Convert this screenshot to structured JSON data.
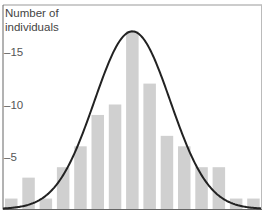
{
  "chart_data": {
    "type": "bar",
    "title": "",
    "xlabel": "",
    "ylabel": "Number of individuals",
    "ylabel_lines": [
      "Number of",
      "individuals"
    ],
    "categories": [
      "1",
      "2",
      "3",
      "4",
      "5",
      "6",
      "7",
      "8",
      "9",
      "10",
      "11",
      "12",
      "13",
      "14",
      "15"
    ],
    "values": [
      1,
      3,
      1,
      4,
      6,
      9,
      10,
      17,
      12,
      7,
      6,
      4,
      4,
      1,
      1
    ],
    "overlay": {
      "type": "normal_curve",
      "peak": 17,
      "color": "#222222"
    },
    "yticks": [
      5,
      10,
      15
    ],
    "ytick_labels": [
      "–5",
      "–10",
      "–15"
    ],
    "ylim": [
      0,
      19
    ],
    "grid": false,
    "legend": null,
    "bar_color": "#d0d0d0"
  }
}
